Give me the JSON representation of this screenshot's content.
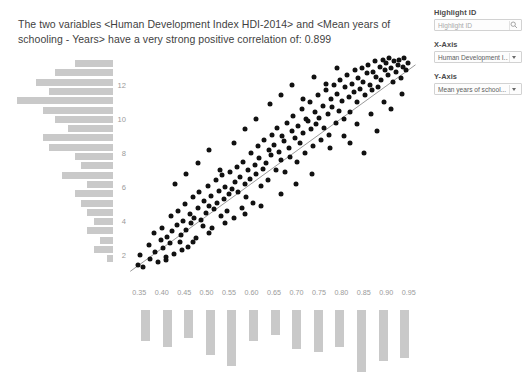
{
  "headline": "The two variables <Human Development Index HDI-2014> and <Mean years of schooling - Years> have a very strong positive correlation of: 0.899",
  "panel": {
    "highlight": {
      "label": "Highlight ID",
      "placeholder": "Highlight ID",
      "value": "",
      "icon": "search-icon"
    },
    "xaxis": {
      "label": "X-Axis",
      "value": "Human Development I...",
      "icon": "chevron-down-icon"
    },
    "yaxis": {
      "label": "Y-Axis",
      "value": "Mean years of school...",
      "icon": "chevron-down-icon"
    }
  },
  "chart_data": {
    "type": "scatter",
    "title": "",
    "xlabel": "Human Development Index HDI-2014",
    "ylabel": "Mean years of schooling - Years",
    "correlation": 0.899,
    "correlation_strength": "a very strong positive correlation",
    "xlim": [
      0.325,
      0.975
    ],
    "ylim": [
      0.6,
      13.6
    ],
    "xticks": [
      0.35,
      0.4,
      0.45,
      0.5,
      0.55,
      0.6,
      0.65,
      0.7,
      0.75,
      0.8,
      0.85,
      0.9,
      0.95
    ],
    "xtick_labels": [
      "0.35",
      "0.40",
      "0.45",
      "0.50",
      "0.55",
      "0.60",
      "0.65",
      "0.70",
      "0.75",
      "0.80",
      "0.85",
      "0.90",
      "0.95"
    ],
    "yticks": [
      2,
      4,
      6,
      8,
      10,
      12
    ],
    "ytick_labels": [
      "2",
      "4",
      "6",
      "8",
      "10",
      "12"
    ],
    "grid": false,
    "legend": false,
    "trendline": {
      "x0": 0.33,
      "y0": 1.05,
      "x1": 0.965,
      "y1": 13.2
    },
    "point_color": "#111111",
    "histogram_color": "#c9c9c9",
    "points": [
      [
        0.348,
        1.4
      ],
      [
        0.352,
        2.0
      ],
      [
        0.358,
        1.3
      ],
      [
        0.371,
        2.6
      ],
      [
        0.374,
        1.8
      ],
      [
        0.383,
        3.3
      ],
      [
        0.386,
        2.2
      ],
      [
        0.392,
        1.6
      ],
      [
        0.399,
        2.9
      ],
      [
        0.401,
        3.6
      ],
      [
        0.404,
        2.4
      ],
      [
        0.409,
        1.9
      ],
      [
        0.412,
        3.1
      ],
      [
        0.418,
        2.7
      ],
      [
        0.421,
        4.3
      ],
      [
        0.424,
        3.4
      ],
      [
        0.428,
        2.1
      ],
      [
        0.433,
        3.8
      ],
      [
        0.437,
        4.6
      ],
      [
        0.441,
        2.8
      ],
      [
        0.444,
        3.2
      ],
      [
        0.448,
        4.0
      ],
      [
        0.452,
        5.0
      ],
      [
        0.455,
        3.5
      ],
      [
        0.459,
        2.5
      ],
      [
        0.462,
        4.4
      ],
      [
        0.466,
        3.9
      ],
      [
        0.47,
        5.4
      ],
      [
        0.473,
        4.2
      ],
      [
        0.477,
        3.0
      ],
      [
        0.481,
        4.8
      ],
      [
        0.484,
        5.7
      ],
      [
        0.488,
        4.1
      ],
      [
        0.492,
        3.7
      ],
      [
        0.495,
        5.2
      ],
      [
        0.498,
        4.5
      ],
      [
        0.502,
        6.1
      ],
      [
        0.505,
        4.9
      ],
      [
        0.509,
        5.5
      ],
      [
        0.512,
        3.6
      ],
      [
        0.516,
        4.7
      ],
      [
        0.52,
        6.4
      ],
      [
        0.523,
        5.1
      ],
      [
        0.527,
        5.8
      ],
      [
        0.531,
        4.3
      ],
      [
        0.534,
        6.7
      ],
      [
        0.538,
        5.3
      ],
      [
        0.541,
        6.0
      ],
      [
        0.545,
        4.6
      ],
      [
        0.549,
        5.6
      ],
      [
        0.552,
        6.9
      ],
      [
        0.556,
        5.9
      ],
      [
        0.56,
        4.2
      ],
      [
        0.563,
        6.3
      ],
      [
        0.567,
        7.2
      ],
      [
        0.57,
        5.7
      ],
      [
        0.574,
        6.6
      ],
      [
        0.578,
        4.8
      ],
      [
        0.581,
        7.5
      ],
      [
        0.585,
        6.2
      ],
      [
        0.588,
        5.4
      ],
      [
        0.592,
        7.0
      ],
      [
        0.596,
        6.5
      ],
      [
        0.599,
        8.0
      ],
      [
        0.603,
        5.1
      ],
      [
        0.607,
        7.3
      ],
      [
        0.61,
        6.8
      ],
      [
        0.614,
        8.4
      ],
      [
        0.617,
        7.7
      ],
      [
        0.621,
        6.1
      ],
      [
        0.625,
        7.1
      ],
      [
        0.628,
        8.8
      ],
      [
        0.632,
        7.4
      ],
      [
        0.636,
        6.4
      ],
      [
        0.639,
        8.2
      ],
      [
        0.643,
        7.9
      ],
      [
        0.646,
        9.1
      ],
      [
        0.65,
        8.5
      ],
      [
        0.654,
        7.0
      ],
      [
        0.657,
        9.5
      ],
      [
        0.661,
        8.1
      ],
      [
        0.665,
        7.6
      ],
      [
        0.668,
        9.0
      ],
      [
        0.672,
        8.7
      ],
      [
        0.675,
        6.9
      ],
      [
        0.679,
        9.8
      ],
      [
        0.683,
        8.3
      ],
      [
        0.686,
        7.8
      ],
      [
        0.69,
        9.3
      ],
      [
        0.693,
        10.2
      ],
      [
        0.697,
        8.9
      ],
      [
        0.701,
        7.5
      ],
      [
        0.704,
        9.6
      ],
      [
        0.708,
        8.6
      ],
      [
        0.712,
        10.6
      ],
      [
        0.715,
        9.2
      ],
      [
        0.719,
        8.0
      ],
      [
        0.722,
        10.0
      ],
      [
        0.726,
        9.9
      ],
      [
        0.73,
        11.0
      ],
      [
        0.733,
        9.4
      ],
      [
        0.737,
        8.4
      ],
      [
        0.741,
        10.4
      ],
      [
        0.744,
        9.7
      ],
      [
        0.748,
        11.4
      ],
      [
        0.751,
        10.1
      ],
      [
        0.755,
        8.8
      ],
      [
        0.759,
        10.8
      ],
      [
        0.762,
        9.5
      ],
      [
        0.766,
        11.7
      ],
      [
        0.77,
        10.3
      ],
      [
        0.773,
        9.1
      ],
      [
        0.777,
        11.2
      ],
      [
        0.78,
        10.7
      ],
      [
        0.784,
        12.0
      ],
      [
        0.788,
        9.8
      ],
      [
        0.791,
        11.5
      ],
      [
        0.795,
        10.5
      ],
      [
        0.798,
        12.3
      ],
      [
        0.802,
        11.1
      ],
      [
        0.806,
        10.0
      ],
      [
        0.809,
        11.9
      ],
      [
        0.813,
        12.6
      ],
      [
        0.817,
        11.3
      ],
      [
        0.82,
        10.4
      ],
      [
        0.824,
        12.1
      ],
      [
        0.827,
        11.6
      ],
      [
        0.831,
        12.9
      ],
      [
        0.835,
        11.0
      ],
      [
        0.838,
        12.4
      ],
      [
        0.842,
        11.8
      ],
      [
        0.846,
        13.0
      ],
      [
        0.849,
        12.2
      ],
      [
        0.853,
        11.4
      ],
      [
        0.856,
        12.7
      ],
      [
        0.86,
        13.2
      ],
      [
        0.864,
        12.0
      ],
      [
        0.868,
        11.7
      ],
      [
        0.871,
        12.8
      ],
      [
        0.875,
        13.4
      ],
      [
        0.878,
        12.5
      ],
      [
        0.882,
        11.9
      ],
      [
        0.886,
        13.1
      ],
      [
        0.889,
        12.3
      ],
      [
        0.893,
        13.5
      ],
      [
        0.896,
        12.9
      ],
      [
        0.9,
        13.3
      ],
      [
        0.904,
        12.6
      ],
      [
        0.907,
        13.6
      ],
      [
        0.911,
        13.0
      ],
      [
        0.915,
        12.2
      ],
      [
        0.918,
        13.4
      ],
      [
        0.922,
        12.8
      ],
      [
        0.926,
        13.2
      ],
      [
        0.929,
        13.5
      ],
      [
        0.933,
        12.4
      ],
      [
        0.937,
        13.1
      ],
      [
        0.94,
        13.6
      ],
      [
        0.944,
        12.9
      ],
      [
        0.948,
        13.3
      ],
      [
        0.43,
        6.2
      ],
      [
        0.455,
        6.8
      ],
      [
        0.48,
        7.4
      ],
      [
        0.505,
        8.2
      ],
      [
        0.53,
        7.0
      ],
      [
        0.56,
        8.6
      ],
      [
        0.585,
        9.4
      ],
      [
        0.61,
        10.0
      ],
      [
        0.64,
        10.9
      ],
      [
        0.665,
        11.4
      ],
      [
        0.69,
        12.0
      ],
      [
        0.715,
        11.2
      ],
      [
        0.74,
        12.5
      ],
      [
        0.765,
        12.1
      ],
      [
        0.79,
        13.0
      ],
      [
        0.665,
        5.6
      ],
      [
        0.7,
        6.2
      ],
      [
        0.735,
        6.8
      ],
      [
        0.62,
        4.9
      ],
      [
        0.585,
        4.4
      ],
      [
        0.54,
        3.9
      ],
      [
        0.505,
        3.3
      ],
      [
        0.47,
        2.8
      ],
      [
        0.445,
        2.3
      ],
      [
        0.41,
        1.7
      ],
      [
        0.775,
        8.3
      ],
      [
        0.805,
        9.0
      ],
      [
        0.835,
        9.7
      ],
      [
        0.865,
        10.3
      ],
      [
        0.895,
        11.0
      ],
      [
        0.82,
        8.6
      ],
      [
        0.85,
        8.0
      ],
      [
        0.88,
        9.3
      ],
      [
        0.91,
        10.6
      ],
      [
        0.935,
        11.5
      ]
    ],
    "x_histogram": {
      "bins": [
        "0.33-0.38",
        "0.38-0.43",
        "0.43-0.48",
        "0.48-0.53",
        "0.53-0.58",
        "0.58-0.63",
        "0.63-0.68",
        "0.68-0.73",
        "0.73-0.78",
        "0.78-0.83",
        "0.83-0.88",
        "0.88-0.93",
        "0.93-0.98"
      ],
      "counts": [
        11,
        13,
        10,
        16,
        20,
        11,
        9,
        14,
        15,
        13,
        22,
        18,
        17
      ],
      "orientation": "vertical-down"
    },
    "y_histogram": {
      "bins": [
        "13",
        "12.5",
        "12",
        "11.5",
        "11",
        "10.5",
        "10",
        "9.5",
        "9",
        "8.5",
        "8",
        "7.5",
        "7",
        "6.5",
        "6",
        "5.5",
        "5",
        "4.5",
        "4",
        "3.5",
        "3",
        "2.5",
        "2",
        "1.5",
        "1"
      ],
      "counts": [
        6,
        9,
        12,
        10,
        15,
        11,
        9,
        7,
        11,
        10,
        6,
        5,
        8,
        4,
        6,
        5,
        4,
        3,
        4,
        2,
        3,
        1
      ],
      "orientation": "horizontal-left"
    }
  }
}
